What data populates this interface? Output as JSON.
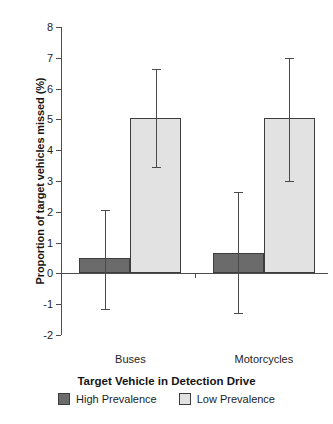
{
  "chart_data": {
    "type": "bar",
    "title": "",
    "xlabel": "Target Vehicle in Detection Drive",
    "ylabel": "Proportion of target vehicles missed (%)",
    "categories": [
      "Buses",
      "Motorcycles"
    ],
    "ylim": [
      -2,
      8
    ],
    "yticks": [
      8,
      7,
      6,
      5,
      4,
      3,
      2,
      1,
      0,
      -1,
      -2
    ],
    "ytick_labels": [
      "8",
      "7",
      "6",
      "5",
      "4",
      "3",
      "2",
      "1",
      "0",
      "-1",
      "-2"
    ],
    "grid": false,
    "legend_position": "bottom",
    "errorbars": true,
    "series": [
      {
        "name": "High Prevalence",
        "color": "#6b6b6b",
        "values": [
          0.5,
          0.65
        ],
        "err_low": [
          1.65,
          1.95
        ],
        "err_high": [
          1.55,
          2.0
        ],
        "ci_low": [
          -1.15,
          -1.3
        ],
        "ci_high": [
          2.05,
          2.65
        ]
      },
      {
        "name": "Low Prevalence",
        "color": "#e2e2e2",
        "values": [
          5.05,
          5.05
        ],
        "err_low": [
          1.6,
          2.05
        ],
        "err_high": [
          1.6,
          1.95
        ],
        "ci_low": [
          3.45,
          3.0
        ],
        "ci_high": [
          6.65,
          7.0
        ]
      }
    ]
  },
  "legend": {
    "items": [
      {
        "label": "High Prevalence",
        "swatch": "high"
      },
      {
        "label": "Low Prevalence",
        "swatch": "low"
      }
    ]
  }
}
